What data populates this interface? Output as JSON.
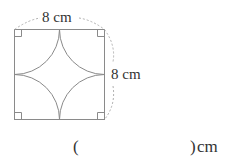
{
  "figure": {
    "shape": "square with four quarter-circle arcs centered at corners",
    "top_label": "8 cm",
    "side_label": "8 cm",
    "colors": {
      "lines": "#8a8a8a",
      "dashed": "#b0b0b0"
    }
  },
  "answer": {
    "open_paren": "(",
    "close_paren": ")",
    "unit": "cm"
  }
}
